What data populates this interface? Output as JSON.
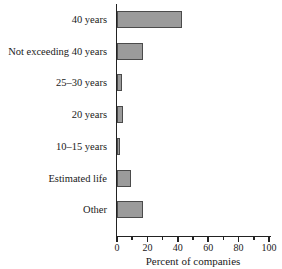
{
  "chart_data": {
    "type": "bar",
    "orientation": "horizontal",
    "categories": [
      "40 years",
      "Not exceeding 40 years",
      "25–30 years",
      "20 years",
      "10–15 years",
      "Estimated life",
      "Other"
    ],
    "values": [
      43,
      17,
      3,
      4,
      2,
      9,
      17
    ],
    "xlabel": "Percent of companies",
    "xlim": [
      0,
      100
    ],
    "x_major_ticks": [
      0,
      20,
      40,
      60,
      80,
      100
    ],
    "x_minor_ticks": [
      10,
      30,
      50,
      70,
      90
    ],
    "grid": false,
    "legend": false,
    "colors": {
      "bar_fill": "#9b9b9b",
      "bar_border": "#4b4b4b",
      "axis": "#222222",
      "text": "#1a1a1a",
      "background": "#ffffff"
    }
  }
}
